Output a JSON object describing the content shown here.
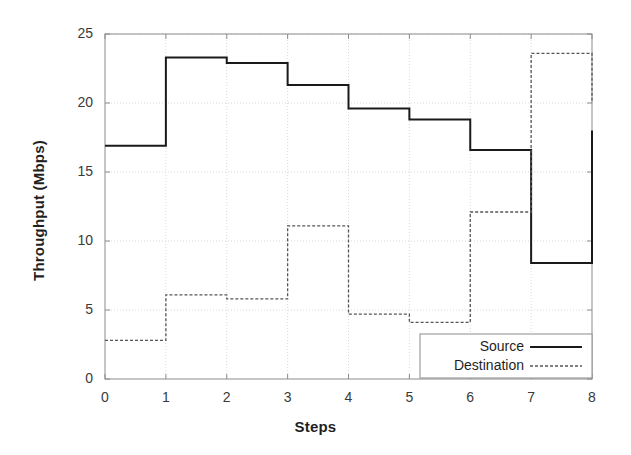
{
  "chart_data": {
    "type": "line",
    "title": "",
    "subtitle": "",
    "xlabel": "Steps",
    "ylabel": "Throughput (Mbps)",
    "xlim": [
      0,
      8
    ],
    "ylim": [
      0,
      25
    ],
    "xticks": [
      "0",
      "1",
      "2",
      "3",
      "4",
      "5",
      "6",
      "7",
      "8"
    ],
    "yticks": [
      "0",
      "5",
      "10",
      "15",
      "20",
      "25"
    ],
    "grid": true,
    "legend_position": "bottom-right",
    "drawstyle": "steps-post",
    "x": [
      0,
      1,
      2,
      3,
      4,
      5,
      6,
      7,
      8
    ],
    "series": [
      {
        "name": "Source",
        "style": "solid",
        "color": "#1a1a1a",
        "values": [
          16.9,
          23.3,
          22.9,
          21.3,
          19.6,
          18.8,
          16.6,
          8.4,
          18.0
        ]
      },
      {
        "name": "Destination",
        "style": "dashed",
        "color": "#555555",
        "values": [
          2.8,
          6.1,
          5.8,
          11.1,
          4.7,
          4.1,
          12.1,
          23.6,
          20.0
        ]
      }
    ],
    "legend": [
      {
        "label": "Source",
        "style": "solid"
      },
      {
        "label": "Destination",
        "style": "dashed"
      }
    ]
  },
  "colors": {
    "source": "#1a1a1a",
    "destination": "#555555",
    "grid": "#d9d9d9",
    "axis": "#8c8c8c",
    "background": "#ffffff"
  }
}
